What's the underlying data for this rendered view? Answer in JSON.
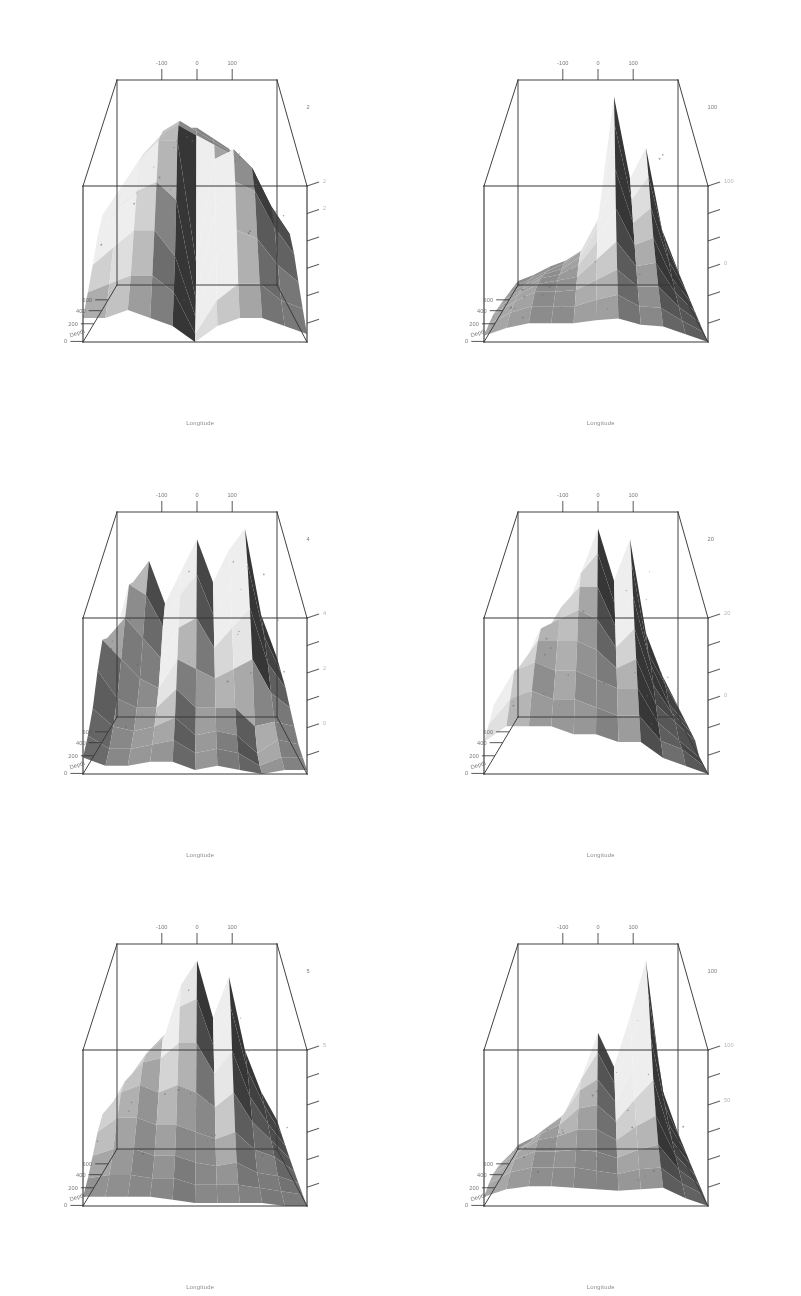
{
  "document": {
    "kind": "scanned-figure-page",
    "layout": {
      "columns": 2,
      "rows": 3,
      "panels": 6
    },
    "background_color": "#ffffff",
    "ink_color": "#2b2b2b"
  },
  "axes": {
    "x": {
      "title": "Longitude",
      "tick_labels": [
        "-100",
        "0",
        "100"
      ],
      "tick_values": [
        -100,
        0,
        100
      ],
      "range": [
        -180,
        180
      ]
    },
    "y": {
      "title": "Depth",
      "tick_labels": [
        "600",
        "400",
        "200",
        "0"
      ],
      "tick_values": [
        600,
        400,
        200,
        0
      ],
      "range": [
        0,
        700
      ]
    },
    "z": {
      "title": "",
      "tick_labels": [
        "",
        "",
        "",
        "",
        "",
        ""
      ]
    }
  },
  "panels": [
    {
      "id": "panel-1",
      "position": "top-left",
      "xlabel": "Longitude",
      "ylabel": "Depth",
      "z_corner_label": "2",
      "z_tick_labels": [
        "2",
        "2",
        "",
        "",
        "",
        ""
      ],
      "y_tick_labels": [
        "600",
        "400",
        "200",
        "0"
      ],
      "x_tick_labels": [
        "-100",
        "0",
        "100"
      ]
    },
    {
      "id": "panel-2",
      "position": "top-right",
      "xlabel": "Longitude",
      "ylabel": "Depth",
      "z_corner_label": "100",
      "z_tick_labels": [
        "100",
        "",
        "",
        "0",
        "",
        ""
      ],
      "y_tick_labels": [
        "600",
        "400",
        "200",
        "0"
      ],
      "x_tick_labels": [
        "-100",
        "0",
        "100"
      ]
    },
    {
      "id": "panel-3",
      "position": "middle-left",
      "xlabel": "Longitude",
      "ylabel": "Depth",
      "z_corner_label": "4",
      "z_tick_labels": [
        "4",
        "",
        "2",
        "",
        "0",
        ""
      ],
      "y_tick_labels": [
        "600",
        "400",
        "200",
        "0"
      ],
      "x_tick_labels": [
        "-100",
        "0",
        "100"
      ]
    },
    {
      "id": "panel-4",
      "position": "middle-right",
      "xlabel": "Longitude",
      "ylabel": "Depth",
      "z_corner_label": "20",
      "z_tick_labels": [
        "20",
        "",
        "",
        "0",
        "",
        ""
      ],
      "y_tick_labels": [
        "600",
        "400",
        "200",
        "0"
      ],
      "x_tick_labels": [
        "-100",
        "0",
        "100"
      ]
    },
    {
      "id": "panel-5",
      "position": "bottom-left",
      "xlabel": "Longitude",
      "ylabel": "Depth",
      "z_corner_label": "5",
      "z_tick_labels": [
        "5",
        "",
        "",
        "",
        "",
        ""
      ],
      "y_tick_labels": [
        "600",
        "400",
        "200",
        "0"
      ],
      "x_tick_labels": [
        "-100",
        "0",
        "100"
      ]
    },
    {
      "id": "panel-6",
      "position": "bottom-right",
      "xlabel": "Longitude",
      "ylabel": "Depth",
      "z_corner_label": "100",
      "z_tick_labels": [
        "100",
        "",
        "50",
        "",
        "",
        ""
      ],
      "y_tick_labels": [
        "600",
        "400",
        "200",
        "0"
      ],
      "x_tick_labels": [
        "-100",
        "0",
        "100"
      ]
    }
  ],
  "chart_data": {
    "type": "surface",
    "title": "",
    "xlabel": "Longitude",
    "ylabel": "Depth",
    "zlabel": "",
    "xlim": [
      -180,
      180
    ],
    "ylim": [
      0,
      700
    ],
    "xticks": [
      -100,
      0,
      100
    ],
    "yticks": [
      600,
      400,
      200,
      0
    ],
    "grid": false,
    "legend": "none",
    "shading": "greyscale",
    "surfaces": [
      {
        "name": "panel-1",
        "zmax_label": "2",
        "character": "broad plateau occupying the upper half of the box, a deep notch cut near longitude 0, a long thin spur trailing down to the right",
        "x": [
          -180,
          -140,
          -100,
          -60,
          -20,
          0,
          20,
          60,
          100,
          140,
          180
        ],
        "y": [
          0,
          100,
          200,
          300,
          400,
          500,
          600,
          700
        ],
        "z": [
          [
            0.7,
            0.9,
            1.2,
            1.5,
            1.6,
            1.6,
            1.5,
            1.4,
            1.2,
            0.9,
            0.6
          ],
          [
            0.8,
            1.1,
            1.4,
            1.7,
            1.8,
            1.7,
            1.6,
            1.5,
            1.3,
            1.0,
            0.7
          ],
          [
            1.0,
            1.3,
            1.6,
            1.8,
            1.9,
            1.8,
            1.7,
            1.6,
            1.4,
            1.1,
            0.8
          ],
          [
            1.1,
            1.4,
            1.7,
            1.9,
            1.9,
            0.6,
            1.7,
            1.8,
            1.6,
            1.2,
            0.9
          ],
          [
            1.0,
            1.3,
            1.5,
            1.6,
            1.4,
            0.3,
            1.3,
            1.6,
            1.5,
            1.1,
            0.8
          ],
          [
            0.8,
            1.0,
            1.2,
            1.2,
            0.9,
            0.2,
            0.9,
            1.2,
            1.1,
            0.8,
            0.6
          ],
          [
            0.6,
            0.7,
            0.8,
            0.8,
            0.6,
            0.1,
            0.5,
            0.7,
            0.7,
            0.5,
            0.4
          ],
          [
            0.4,
            0.4,
            0.5,
            0.4,
            0.3,
            0.1,
            0.3,
            0.4,
            0.4,
            0.3,
            0.2
          ]
        ]
      },
      {
        "name": "panel-2",
        "zmax_label": "100",
        "character": "tall narrow spike near longitude 20 reaching the top of the box, a secondary ridge to its right, broad low shelf across the left half",
        "x": [
          -180,
          -140,
          -100,
          -60,
          -20,
          0,
          20,
          60,
          100,
          140,
          180
        ],
        "y": [
          0,
          100,
          200,
          300,
          400,
          500,
          600,
          700
        ],
        "z": [
          [
            5,
            8,
            12,
            15,
            20,
            35,
            95,
            55,
            70,
            30,
            10
          ],
          [
            6,
            10,
            14,
            18,
            24,
            40,
            88,
            50,
            62,
            28,
            9
          ],
          [
            7,
            12,
            17,
            20,
            26,
            42,
            72,
            44,
            52,
            24,
            8
          ],
          [
            8,
            14,
            20,
            22,
            27,
            40,
            58,
            38,
            42,
            20,
            7
          ],
          [
            9,
            16,
            22,
            24,
            26,
            36,
            46,
            32,
            34,
            17,
            6
          ],
          [
            10,
            17,
            23,
            23,
            24,
            30,
            36,
            26,
            26,
            14,
            5
          ],
          [
            9,
            16,
            20,
            20,
            20,
            24,
            27,
            20,
            19,
            11,
            4
          ],
          [
            7,
            12,
            15,
            15,
            15,
            17,
            18,
            14,
            13,
            8,
            3
          ]
        ]
      },
      {
        "name": "panel-3",
        "zmax_label": "4",
        "character": "jagged mid-height surface with several sharp downward wedges and a deep narrow trough at the right edge running to the base",
        "x": [
          -180,
          -140,
          -100,
          -60,
          -20,
          0,
          20,
          60,
          100,
          140,
          180
        ],
        "y": [
          0,
          100,
          200,
          300,
          400,
          500,
          600,
          700
        ],
        "z": [
          [
            1.4,
            2.6,
            3.0,
            2.2,
            2.8,
            3.4,
            2.6,
            3.2,
            3.6,
            2.0,
            1.2
          ],
          [
            1.6,
            2.8,
            2.6,
            2.0,
            2.6,
            3.0,
            2.2,
            2.8,
            3.2,
            1.8,
            1.1
          ],
          [
            2.0,
            2.4,
            2.0,
            1.6,
            2.2,
            2.4,
            1.8,
            2.2,
            2.6,
            1.5,
            1.0
          ],
          [
            2.2,
            1.8,
            1.4,
            1.2,
            1.8,
            1.6,
            1.4,
            1.6,
            1.8,
            1.1,
            0.8
          ],
          [
            1.8,
            1.2,
            1.0,
            1.0,
            1.4,
            1.0,
            1.0,
            1.0,
            0.6,
            0.7,
            0.6
          ],
          [
            1.2,
            0.8,
            0.7,
            0.8,
            1.0,
            0.6,
            0.7,
            0.6,
            0.2,
            0.5,
            0.4
          ],
          [
            0.8,
            0.5,
            0.5,
            0.6,
            0.7,
            0.4,
            0.5,
            0.4,
            0.1,
            0.3,
            0.3
          ],
          [
            0.5,
            0.3,
            0.3,
            0.4,
            0.4,
            0.2,
            0.3,
            0.2,
            0.1,
            0.2,
            0.2
          ]
        ]
      },
      {
        "name": "panel-4",
        "zmax_label": "20",
        "character": "two tall pale spires near longitude 0 and 60 rising to the box top, flanked by broad smooth flanks sweeping down to the front base",
        "x": [
          -180,
          -140,
          -100,
          -60,
          -20,
          0,
          20,
          60,
          100,
          140,
          180
        ],
        "y": [
          0,
          100,
          200,
          300,
          400,
          500,
          600,
          700
        ],
        "z": [
          [
            2,
            4,
            7,
            10,
            15,
            19,
            14,
            18,
            9,
            5,
            2
          ],
          [
            3,
            5,
            9,
            12,
            16,
            18,
            13,
            17,
            8,
            5,
            2
          ],
          [
            4,
            7,
            11,
            14,
            16,
            16,
            12,
            15,
            8,
            4,
            2
          ],
          [
            5,
            9,
            13,
            14,
            15,
            14,
            11,
            13,
            7,
            4,
            2
          ],
          [
            6,
            10,
            13,
            13,
            13,
            12,
            10,
            11,
            6,
            4,
            2
          ],
          [
            7,
            11,
            12,
            11,
            11,
            10,
            9,
            9,
            5,
            3,
            1
          ],
          [
            6,
            9,
            10,
            9,
            9,
            8,
            7,
            7,
            4,
            3,
            1
          ],
          [
            5,
            7,
            7,
            7,
            6,
            6,
            5,
            5,
            3,
            2,
            1
          ]
        ]
      },
      {
        "name": "panel-5",
        "zmax_label": "5",
        "character": "central pair of bright spikes near longitude 0 and 60 with a pale horizontal break band across the middle and dark wedges below",
        "x": [
          -180,
          -140,
          -100,
          -60,
          -20,
          0,
          20,
          60,
          100,
          140,
          180
        ],
        "y": [
          0,
          100,
          200,
          300,
          400,
          500,
          600,
          700
        ],
        "z": [
          [
            1.2,
            2.0,
            2.6,
            3.0,
            4.2,
            4.8,
            3.4,
            4.4,
            2.6,
            1.6,
            0.9
          ],
          [
            1.4,
            2.2,
            2.8,
            3.2,
            4.0,
            4.2,
            3.0,
            4.0,
            2.4,
            1.5,
            0.8
          ],
          [
            1.6,
            2.4,
            2.9,
            3.0,
            3.4,
            3.4,
            2.6,
            3.2,
            2.0,
            1.3,
            0.7
          ],
          [
            1.8,
            2.4,
            2.6,
            2.4,
            2.6,
            2.4,
            2.0,
            2.4,
            1.6,
            1.1,
            0.6
          ],
          [
            1.6,
            2.0,
            2.0,
            1.8,
            1.8,
            1.6,
            1.4,
            1.6,
            1.1,
            0.9,
            0.5
          ],
          [
            1.2,
            1.4,
            1.4,
            1.2,
            1.2,
            1.0,
            0.9,
            1.0,
            0.7,
            0.6,
            0.4
          ],
          [
            0.8,
            0.9,
            0.9,
            0.8,
            0.8,
            0.6,
            0.6,
            0.6,
            0.5,
            0.4,
            0.3
          ],
          [
            0.5,
            0.5,
            0.5,
            0.5,
            0.4,
            0.3,
            0.3,
            0.3,
            0.3,
            0.2,
            0.2
          ]
        ]
      },
      {
        "name": "panel-6",
        "zmax_label": "100",
        "character": "single dominant dark spike at the right reaching the box top, a pale secondary peak near longitude 0, broad shaded apron across the whole base",
        "x": [
          -180,
          -140,
          -100,
          -60,
          -20,
          0,
          20,
          60,
          100,
          140,
          180
        ],
        "y": [
          0,
          100,
          200,
          300,
          400,
          500,
          600,
          700
        ],
        "z": [
          [
            6,
            10,
            16,
            22,
            40,
            62,
            45,
            70,
            98,
            34,
            12
          ],
          [
            7,
            12,
            19,
            26,
            44,
            58,
            42,
            64,
            88,
            30,
            11
          ],
          [
            9,
            15,
            23,
            30,
            44,
            50,
            38,
            55,
            72,
            26,
            10
          ],
          [
            11,
            18,
            26,
            31,
            40,
            42,
            33,
            45,
            56,
            22,
            9
          ],
          [
            13,
            21,
            28,
            30,
            34,
            34,
            28,
            36,
            42,
            19,
            8
          ],
          [
            14,
            22,
            27,
            27,
            28,
            27,
            23,
            28,
            31,
            16,
            7
          ],
          [
            13,
            20,
            23,
            23,
            23,
            21,
            19,
            22,
            23,
            13,
            6
          ],
          [
            10,
            15,
            17,
            17,
            16,
            15,
            14,
            15,
            16,
            9,
            4
          ]
        ]
      }
    ]
  }
}
